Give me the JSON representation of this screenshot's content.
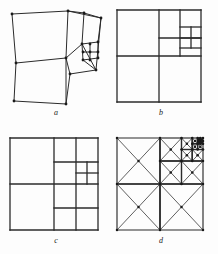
{
  "figure": {
    "background_color": "#fdfdfd",
    "line_color": "#2b2b2b",
    "vertex_color": "#1a1a1a",
    "width": 218,
    "height": 254
  },
  "panels": [
    {
      "id": "a",
      "label": "a",
      "caption": "a",
      "kind": "warped-quadrilateral-mesh",
      "description": "Distorted curvilinear version of the subdivision of panel b; cells are irregular quadrilaterals with marked vertices.",
      "show_vertices": true,
      "show_diagonals": false,
      "outline": [
        [
          4,
          6
        ],
        [
          60,
          3
        ],
        [
          93,
          10
        ],
        [
          88,
          62
        ],
        [
          62,
          66
        ],
        [
          58,
          96
        ],
        [
          6,
          93
        ],
        [
          8,
          55
        ]
      ],
      "edges": [
        [
          [
            4,
            6
          ],
          [
            60,
            3
          ]
        ],
        [
          [
            60,
            3
          ],
          [
            93,
            10
          ]
        ],
        [
          [
            93,
            10
          ],
          [
            88,
            62
          ]
        ],
        [
          [
            88,
            62
          ],
          [
            62,
            66
          ]
        ],
        [
          [
            62,
            66
          ],
          [
            58,
            96
          ]
        ],
        [
          [
            58,
            96
          ],
          [
            6,
            93
          ]
        ],
        [
          [
            6,
            93
          ],
          [
            8,
            55
          ]
        ],
        [
          [
            8,
            55
          ],
          [
            4,
            6
          ]
        ],
        [
          [
            8,
            55
          ],
          [
            58,
            50
          ]
        ],
        [
          [
            58,
            50
          ],
          [
            62,
            66
          ]
        ],
        [
          [
            58,
            50
          ],
          [
            60,
            3
          ]
        ],
        [
          [
            58,
            96
          ],
          [
            58,
            50
          ]
        ],
        [
          [
            60,
            3
          ],
          [
            76,
            5
          ]
        ],
        [
          [
            76,
            5
          ],
          [
            93,
            10
          ]
        ],
        [
          [
            76,
            5
          ],
          [
            74,
            36
          ]
        ],
        [
          [
            58,
            50
          ],
          [
            74,
            36
          ]
        ],
        [
          [
            74,
            36
          ],
          [
            88,
            62
          ]
        ],
        [
          [
            74,
            36
          ],
          [
            90,
            34
          ]
        ],
        [
          [
            90,
            34
          ],
          [
            93,
            10
          ]
        ],
        [
          [
            74,
            36
          ],
          [
            75,
            52
          ]
        ],
        [
          [
            75,
            52
          ],
          [
            88,
            62
          ]
        ],
        [
          [
            75,
            52
          ],
          [
            90,
            50
          ]
        ],
        [
          [
            90,
            50
          ],
          [
            90,
            34
          ]
        ],
        [
          [
            82,
            36
          ],
          [
            82,
            52
          ]
        ],
        [
          [
            75,
            44
          ],
          [
            90,
            44
          ]
        ]
      ],
      "vertices": [
        [
          4,
          6
        ],
        [
          60,
          3
        ],
        [
          93,
          10
        ],
        [
          88,
          62
        ],
        [
          62,
          66
        ],
        [
          58,
          96
        ],
        [
          6,
          93
        ],
        [
          8,
          55
        ],
        [
          58,
          50
        ],
        [
          76,
          5
        ],
        [
          74,
          36
        ],
        [
          90,
          34
        ],
        [
          75,
          52
        ],
        [
          90,
          50
        ],
        [
          82,
          36
        ],
        [
          82,
          52
        ],
        [
          75,
          44
        ],
        [
          90,
          44
        ],
        [
          82,
          44
        ]
      ]
    },
    {
      "id": "b",
      "label": "b",
      "caption": "b",
      "kind": "axis-aligned-quadtree",
      "description": "Square subdivided recursively toward the upper-right corner: one large cell, then halves, quarters and eighths nested into the top-right.",
      "show_vertices": false,
      "show_diagonals": false,
      "outline": [
        [
          2,
          2
        ],
        [
          86,
          2
        ],
        [
          86,
          94
        ],
        [
          2,
          94
        ]
      ],
      "edges": [
        [
          [
            2,
            2
          ],
          [
            86,
            2
          ]
        ],
        [
          [
            86,
            2
          ],
          [
            86,
            94
          ]
        ],
        [
          [
            86,
            94
          ],
          [
            2,
            94
          ]
        ],
        [
          [
            2,
            94
          ],
          [
            2,
            2
          ]
        ],
        [
          [
            2,
            48
          ],
          [
            86,
            48
          ]
        ],
        [
          [
            44,
            2
          ],
          [
            44,
            94
          ]
        ],
        [
          [
            44,
            30
          ],
          [
            86,
            30
          ]
        ],
        [
          [
            65,
            2
          ],
          [
            65,
            48
          ]
        ],
        [
          [
            65,
            19
          ],
          [
            86,
            19
          ]
        ],
        [
          [
            65,
            40
          ],
          [
            86,
            40
          ]
        ],
        [
          [
            76,
            19
          ],
          [
            76,
            40
          ]
        ],
        [
          [
            65,
            30
          ],
          [
            86,
            30
          ]
        ]
      ]
    },
    {
      "id": "c",
      "label": "c",
      "caption": "c",
      "kind": "axis-aligned-quadtree-variant",
      "description": "Same outer square as b but the lower-right quadrant is also subdivided into smaller rectangles.",
      "show_vertices": false,
      "show_diagonals": false,
      "outline": [
        [
          2,
          2
        ],
        [
          90,
          2
        ],
        [
          90,
          94
        ],
        [
          2,
          94
        ]
      ],
      "edges": [
        [
          [
            2,
            2
          ],
          [
            90,
            2
          ]
        ],
        [
          [
            90,
            2
          ],
          [
            90,
            94
          ]
        ],
        [
          [
            90,
            94
          ],
          [
            2,
            94
          ]
        ],
        [
          [
            2,
            94
          ],
          [
            2,
            2
          ]
        ],
        [
          [
            2,
            48
          ],
          [
            90,
            48
          ]
        ],
        [
          [
            46,
            2
          ],
          [
            46,
            94
          ]
        ],
        [
          [
            46,
            26
          ],
          [
            90,
            26
          ]
        ],
        [
          [
            68,
            2
          ],
          [
            68,
            48
          ]
        ],
        [
          [
            68,
            37
          ],
          [
            90,
            37
          ]
        ],
        [
          [
            79,
            26
          ],
          [
            79,
            48
          ]
        ],
        [
          [
            46,
            72
          ],
          [
            90,
            72
          ]
        ],
        [
          [
            68,
            48
          ],
          [
            68,
            94
          ]
        ]
      ]
    },
    {
      "id": "d",
      "label": "d",
      "caption": "d",
      "kind": "recursive-triangulation",
      "description": "Square with criss-cross diagonals in every cell, recursively refined toward an interior point on the right; all mesh vertices marked with dots.",
      "show_vertices": true,
      "show_diagonals": true,
      "outline": [
        [
          2,
          2
        ],
        [
          88,
          2
        ],
        [
          88,
          94
        ],
        [
          2,
          94
        ]
      ],
      "levels": 5,
      "focus": [
        66,
        34
      ]
    }
  ],
  "labels": {
    "a": "a",
    "b": "b",
    "c": "c",
    "d": "d"
  }
}
